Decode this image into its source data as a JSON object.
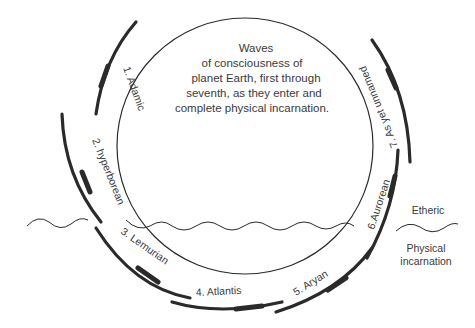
{
  "diagram": {
    "center_text": [
      "Waves",
      "of consciousness of",
      "planet Earth, first through",
      "seventh, as they enter and",
      "complete physical incarnation."
    ],
    "waves": [
      {
        "number": "1.",
        "name": "Adamic",
        "label": "1. Adamic"
      },
      {
        "number": "2.",
        "name": "hyperborean",
        "label": "2. hyperborean"
      },
      {
        "number": "3.",
        "name": "Lemurian",
        "label": "3. Lemurian"
      },
      {
        "number": "4.",
        "name": "Atlantis",
        "label": "4. Atlantis"
      },
      {
        "number": "5.",
        "name": "Aryan",
        "label": "5. Aryan"
      },
      {
        "number": "6.",
        "name": "Aurorean",
        "label": "6.Aurorean"
      },
      {
        "number": "7.",
        "name": "As yet unnamed",
        "label": "7. As yet unnamed"
      }
    ],
    "legend": {
      "upper": "Etheric",
      "lower_line1": "Physical",
      "lower_line2": "incarnation"
    },
    "colors": {
      "ink": "#2a2a2a",
      "text": "#3a3a3a",
      "background": "#ffffff"
    }
  }
}
